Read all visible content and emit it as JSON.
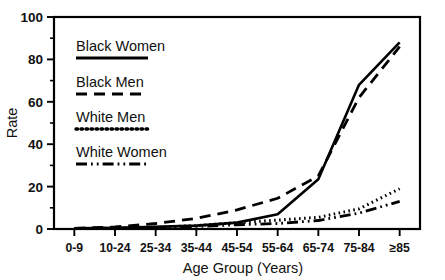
{
  "chart_data": {
    "type": "line",
    "title": "",
    "xlabel": "Age Group (Years)",
    "ylabel": "Rate",
    "categories": [
      "0-9",
      "10-24",
      "25-34",
      "35-44",
      "45-54",
      "55-64",
      "65-74",
      "75-84",
      "≥85"
    ],
    "ylim": [
      0,
      100
    ],
    "yticks": [
      0,
      20,
      40,
      60,
      80,
      100
    ],
    "yticks_minor": [
      10,
      30,
      50,
      70,
      90
    ],
    "grid": false,
    "legend_position": "upper-left-inside",
    "series": [
      {
        "name": "Black Women",
        "linestyle": "solid",
        "color": "#000000",
        "values": [
          0.3,
          0.6,
          1.0,
          1.6,
          3.0,
          7.0,
          23.5,
          68.0,
          88.0
        ]
      },
      {
        "name": "Black Men",
        "linestyle": "dashed",
        "color": "#000000",
        "values": [
          0.3,
          1.0,
          2.6,
          5.0,
          9.0,
          14.5,
          25.0,
          62.0,
          86.0
        ]
      },
      {
        "name": "White Men",
        "linestyle": "dotted",
        "color": "#000000",
        "values": [
          0.2,
          0.4,
          0.8,
          1.6,
          3.0,
          4.2,
          5.5,
          9.5,
          19.0
        ]
      },
      {
        "name": "White Women",
        "linestyle": "dash-dot-dot",
        "color": "#000000",
        "values": [
          0.2,
          0.3,
          0.6,
          1.2,
          2.0,
          2.6,
          4.0,
          7.5,
          13.0
        ]
      }
    ]
  },
  "axes": {
    "y_tick_labels": [
      "0",
      "20",
      "40",
      "60",
      "80",
      "100"
    ],
    "y_title": "Rate",
    "x_title": "Age Group (Years)",
    "x_tick_labels": [
      "0-9",
      "10-24",
      "25-34",
      "35-44",
      "45-54",
      "55-64",
      "65-74",
      "75-84",
      "≥85"
    ]
  },
  "legend": {
    "entries": [
      {
        "label": "Black Women",
        "style": "solid"
      },
      {
        "label": "Black Men",
        "style": "dashed"
      },
      {
        "label": "White Men",
        "style": "dotted"
      },
      {
        "label": "White Women",
        "style": "dash-dot-dot"
      }
    ]
  }
}
